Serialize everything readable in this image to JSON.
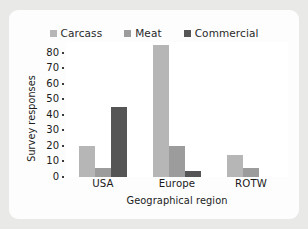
{
  "figure": {
    "background_color": "#e9e9e7",
    "card_color": "#fdfdfd"
  },
  "chart_data": {
    "type": "bar",
    "title": "",
    "subtitle": "",
    "xlabel": "Geographical region",
    "ylabel": "Survey responses",
    "categories": [
      "USA",
      "Europe",
      "ROTW"
    ],
    "series": [
      {
        "name": "Carcass",
        "color": "#b6b6b6",
        "values": [
          20,
          85,
          14
        ]
      },
      {
        "name": "Meat",
        "color": "#9c9c9c",
        "values": [
          6,
          20,
          6
        ]
      },
      {
        "name": "Commercial",
        "color": "#555555",
        "values": [
          45,
          4,
          0
        ]
      }
    ],
    "ylim": [
      0,
      87
    ],
    "yticks": [
      0,
      10,
      20,
      30,
      40,
      50,
      60,
      70,
      80
    ],
    "ytick_labels": [
      "0",
      "10",
      "20",
      "30",
      "40",
      "50",
      "60",
      "70",
      "80"
    ],
    "grid": false,
    "legend_position": "top",
    "bar_group_gap": 0.34,
    "note_top_clipped_series": "Carcass/Europe extends to the top edge of the axes"
  }
}
